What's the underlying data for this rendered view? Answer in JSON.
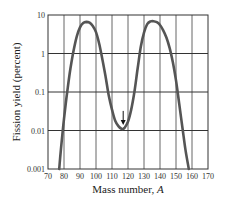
{
  "chart_data": {
    "type": "line",
    "title": "",
    "xlabel": "Mass number, A",
    "xlabel_main": "Mass number, ",
    "xlabel_var": "A",
    "ylabel": "Fission yield (percent)",
    "yscale": "log",
    "xlim": [
      70,
      170
    ],
    "ylim": [
      0.001,
      10
    ],
    "grid": true,
    "x_ticks": [
      "70",
      "80",
      "90",
      "100",
      "110",
      "120",
      "130",
      "140",
      "150",
      "160",
      "170"
    ],
    "y_ticks": [
      "10",
      "1",
      "0.1",
      "0.01",
      "0.001"
    ],
    "series": [
      {
        "name": "Fission yield",
        "x": [
          77,
          78,
          80,
          82,
          84,
          86,
          88,
          90,
          92,
          94,
          96,
          98,
          100,
          102,
          104,
          106,
          108,
          110,
          112,
          114,
          116,
          117,
          118,
          120,
          122,
          124,
          126,
          128,
          130,
          132,
          134,
          136,
          138,
          140,
          142,
          144,
          146,
          148,
          150,
          152,
          154,
          156,
          158
        ],
        "y": [
          0.001,
          0.003,
          0.02,
          0.1,
          0.4,
          1.2,
          2.8,
          4.8,
          6.2,
          6.6,
          6.3,
          5.2,
          3.6,
          1.8,
          0.7,
          0.25,
          0.08,
          0.035,
          0.018,
          0.013,
          0.011,
          0.011,
          0.012,
          0.017,
          0.035,
          0.1,
          0.4,
          1.5,
          3.5,
          5.8,
          6.8,
          6.9,
          6.5,
          5.5,
          4.0,
          2.6,
          1.4,
          0.6,
          0.2,
          0.05,
          0.012,
          0.003,
          0.001
        ]
      }
    ],
    "annotations": [
      {
        "type": "arrow",
        "x": 117,
        "y": 0.011,
        "text": ""
      }
    ]
  }
}
